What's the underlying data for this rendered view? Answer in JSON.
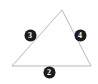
{
  "diagram": {
    "type": "triangle-with-side-labels",
    "shape_name": "triangle",
    "stroke_color": "#b8b8b8",
    "badge_fill_color": "#1c1c1c",
    "badge_text_color": "#ffffff",
    "background_color": "#fefefe",
    "vertices": {
      "apex": {
        "x": 62,
        "y": 10
      },
      "bottom_left": {
        "x": 12,
        "y": 66
      },
      "bottom_right": {
        "x": 91,
        "y": 66
      }
    },
    "polygon_points": "62,10 91,66 12,66",
    "side_labels": [
      {
        "name": "left-side",
        "value": "3",
        "x": 30,
        "y": 35
      },
      {
        "name": "right-side",
        "value": "4",
        "x": 80,
        "y": 35
      },
      {
        "name": "bottom-side",
        "value": "2",
        "x": 49,
        "y": 72
      }
    ]
  }
}
